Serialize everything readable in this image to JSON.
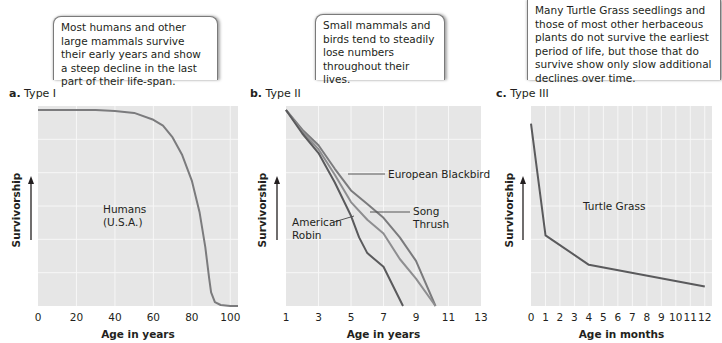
{
  "callouts": {
    "a": "Most humans and other large mammals survive their early years and show a steep decline in the last part of their life-span.",
    "b": "Small mammals and birds tend to steadily lose numbers throughout their lives.",
    "c": "Many Turtle Grass seedlings and those of most other herbaceous plants do not survive the earliest period of life, but those that do survive show only slow additional declines over time."
  },
  "panels": {
    "a": {
      "letter": "a.",
      "title": "Type I"
    },
    "b": {
      "letter": "b.",
      "title": "Type II"
    },
    "c": {
      "letter": "c.",
      "title": "Type III"
    }
  },
  "colors": {
    "plot_bg": "#e6e6e6",
    "grid": "#f7f7f7",
    "line_dark": "#5a5a5c",
    "line_mid": "#7b7b7d",
    "line_light": "#8e8e90"
  },
  "chart_data": [
    {
      "type": "line",
      "title": "a. Type I",
      "xlabel": "Age in years",
      "ylabel": "Survivorship",
      "xticks": [
        "0",
        "20",
        "40",
        "60",
        "80",
        "100"
      ],
      "xlim": [
        0,
        104
      ],
      "ylim": [
        0,
        100
      ],
      "grid": true,
      "annotations": [
        "Humans",
        "(U.S.A.)"
      ],
      "series": [
        {
          "name": "Humans (U.S.A.)",
          "x": [
            0,
            30,
            40,
            50,
            60,
            65,
            70,
            75,
            80,
            84,
            87,
            89,
            90,
            92,
            95,
            100,
            104
          ],
          "y": [
            100,
            100,
            99.5,
            98.5,
            95,
            92,
            86,
            77,
            64,
            48,
            30,
            14,
            7,
            2,
            0.5,
            0,
            0
          ]
        }
      ]
    },
    {
      "type": "line",
      "title": "b. Type II",
      "xlabel": "Age in years",
      "ylabel": "Survivorship",
      "xticks": [
        "1",
        "3",
        "5",
        "7",
        "9",
        "11",
        "13"
      ],
      "xlim": [
        1,
        13
      ],
      "ylim": [
        0,
        100
      ],
      "grid": true,
      "series": [
        {
          "name": "European Blackbird",
          "x": [
            1,
            2,
            3,
            4,
            5,
            6,
            7,
            8,
            9,
            10.2
          ],
          "y": [
            100,
            90,
            82,
            70,
            59,
            52,
            45,
            35,
            23,
            0
          ]
        },
        {
          "name": "Song Thrush",
          "x": [
            1,
            2,
            3,
            4,
            5,
            6,
            7,
            8,
            9,
            10.2
          ],
          "y": [
            100,
            89,
            80,
            67,
            53,
            44,
            37,
            24,
            14,
            0
          ]
        },
        {
          "name": "American Robin",
          "x": [
            1,
            2,
            3,
            4,
            5,
            5.5,
            6,
            7,
            8.2
          ],
          "y": [
            100,
            88,
            78,
            63,
            46,
            35,
            27,
            20,
            0
          ]
        }
      ]
    },
    {
      "type": "line",
      "title": "c. Type III",
      "xlabel": "Age in months",
      "ylabel": "Survivorship",
      "xticks": [
        "0",
        "1",
        "2",
        "3",
        "4",
        "5",
        "6",
        "7",
        "8",
        "9",
        "10",
        "11",
        "12"
      ],
      "xlim": [
        0,
        12.5
      ],
      "ylim": [
        0,
        100
      ],
      "grid": true,
      "annotations": [
        "Turtle Grass"
      ],
      "series": [
        {
          "name": "Turtle Grass",
          "x": [
            0,
            1,
            4,
            12
          ],
          "y": [
            93,
            36,
            21,
            10
          ]
        }
      ]
    }
  ]
}
